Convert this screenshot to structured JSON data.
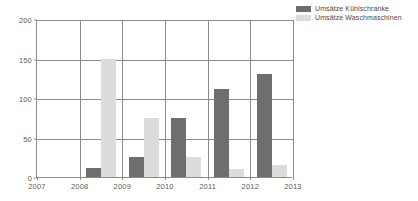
{
  "chart_data": {
    "type": "bar",
    "title": "",
    "subtitle": "",
    "xlabel": "",
    "ylabel": "",
    "categories": [
      "2007",
      "2008",
      "2009",
      "2010",
      "2011",
      "2012"
    ],
    "xtick_labels": [
      "2007",
      "2008",
      "2009",
      "2010",
      "2011",
      "2012",
      "2013"
    ],
    "ytick_labels": [
      "0",
      "50",
      "100",
      "150",
      "200"
    ],
    "ytick_values": [
      0,
      50,
      100,
      150,
      200
    ],
    "ylim": [
      0,
      200
    ],
    "grid": true,
    "grid_axis": "both",
    "legend_position": "top-right",
    "series": [
      {
        "name": "Umsätze Kühlschranke",
        "color": "#6e6e6e",
        "values": [
          0,
          12,
          25,
          75,
          112,
          130
        ]
      },
      {
        "name": "Umsätze Waschmaschinen",
        "color": "#dcdcdc",
        "values": [
          0,
          150,
          75,
          25,
          10,
          15
        ]
      }
    ]
  },
  "legend": {
    "items": [
      {
        "label": "Umsätze Kühlschranke",
        "color": "#6e6e6e"
      },
      {
        "label": "Umsätze Waschmaschinen",
        "color": "#dcdcdc"
      }
    ]
  },
  "colors": {
    "series_dark": "#6e6e6e",
    "series_light": "#dcdcdc",
    "axis": "#8a8a8a",
    "grid": "#8a8a8a",
    "tick_text": "#5a5a5a",
    "legend_text": "#4a4a4a",
    "background": "#ffffff"
  }
}
